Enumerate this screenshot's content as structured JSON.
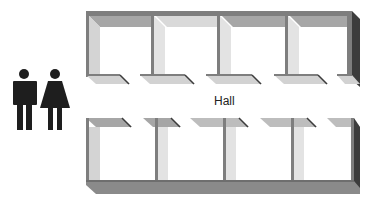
{
  "diagram": {
    "type": "floor-plan",
    "hall_label": "Hall",
    "restroom_icon": {
      "figures": [
        "man",
        "woman"
      ],
      "color": "#1e1e1e"
    },
    "rows": [
      {
        "name": "top-row",
        "room_count": 4
      },
      {
        "name": "bottom-row",
        "room_count": 4
      }
    ],
    "colors": {
      "wall_top": "#8a8a8a",
      "wall_light": "#d6d6d6",
      "wall_mid": "#a9a9a9",
      "wall_dark": "#3c3c3c",
      "floor": "#ffffff"
    }
  }
}
